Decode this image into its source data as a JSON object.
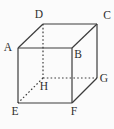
{
  "figure": {
    "kind": "cube-wireframe-diagram",
    "background_color": "#fbfbfb",
    "line_color": "#3c3c3c",
    "text_color": "#2e2e2e",
    "width": 114,
    "height": 129,
    "vertices": [
      {
        "id": "A",
        "label": "A",
        "x": 18,
        "y": 48,
        "label_x": 8,
        "label_y": 47
      },
      {
        "id": "B",
        "label": "B",
        "x": 72,
        "y": 48,
        "label_x": 78,
        "label_y": 54
      },
      {
        "id": "C",
        "label": "C",
        "x": 97,
        "y": 24,
        "label_x": 107,
        "label_y": 15
      },
      {
        "id": "D",
        "label": "D",
        "x": 43,
        "y": 24,
        "label_x": 39,
        "label_y": 14
      },
      {
        "id": "E",
        "label": "E",
        "x": 18,
        "y": 103,
        "label_x": 15,
        "label_y": 111
      },
      {
        "id": "F",
        "label": "F",
        "x": 72,
        "y": 103,
        "label_x": 74,
        "label_y": 111
      },
      {
        "id": "G",
        "label": "G",
        "x": 97,
        "y": 78,
        "label_x": 104,
        "label_y": 78
      },
      {
        "id": "H",
        "label": "H",
        "x": 43,
        "y": 78,
        "label_x": 44,
        "label_y": 86
      }
    ],
    "edges": [
      {
        "from": "A",
        "to": "B",
        "style": "solid"
      },
      {
        "from": "D",
        "to": "C",
        "style": "solid"
      },
      {
        "from": "A",
        "to": "D",
        "style": "solid"
      },
      {
        "from": "B",
        "to": "C",
        "style": "solid"
      },
      {
        "from": "A",
        "to": "E",
        "style": "solid"
      },
      {
        "from": "B",
        "to": "F",
        "style": "solid"
      },
      {
        "from": "C",
        "to": "G",
        "style": "solid"
      },
      {
        "from": "E",
        "to": "F",
        "style": "solid"
      },
      {
        "from": "F",
        "to": "G",
        "style": "solid"
      },
      {
        "from": "D",
        "to": "H",
        "style": "dashed"
      },
      {
        "from": "H",
        "to": "G",
        "style": "dashed"
      },
      {
        "from": "H",
        "to": "E",
        "style": "dashed"
      }
    ]
  }
}
